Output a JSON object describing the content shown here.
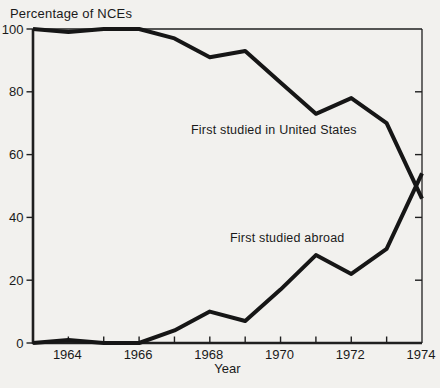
{
  "figure": {
    "y_axis_title": "Percentage of NCEs",
    "x_axis_title": "Year"
  },
  "chart_data": {
    "type": "line",
    "title": "Percentage of NCEs",
    "xlabel": "Year",
    "ylabel": "Percentage of NCEs",
    "x": [
      1963,
      1964,
      1965,
      1966,
      1967,
      1968,
      1969,
      1970,
      1971,
      1972,
      1973,
      1974
    ],
    "series": [
      {
        "name": "First studied in United States",
        "values": [
          100,
          99,
          100,
          100,
          97,
          91,
          93,
          83,
          73,
          78,
          70,
          46
        ]
      },
      {
        "name": "First studied abroad",
        "values": [
          0,
          1,
          0,
          0,
          4,
          10,
          7,
          17,
          28,
          22,
          30,
          54
        ]
      }
    ],
    "xlim": [
      1963,
      1974
    ],
    "ylim": [
      0,
      100
    ],
    "yticks": [
      0,
      20,
      40,
      60,
      80,
      100
    ],
    "xtick_labels": [
      1964,
      1966,
      1968,
      1970,
      1972,
      1974
    ],
    "xticks_minor": [
      1964,
      1965,
      1966,
      1967,
      1968,
      1969,
      1970,
      1971,
      1972,
      1973
    ],
    "grid": false,
    "legend_position": "inline-annotations",
    "line_color": "#161616",
    "axis_color": "#1f1f1f",
    "background_color": "#f2f1ee"
  }
}
